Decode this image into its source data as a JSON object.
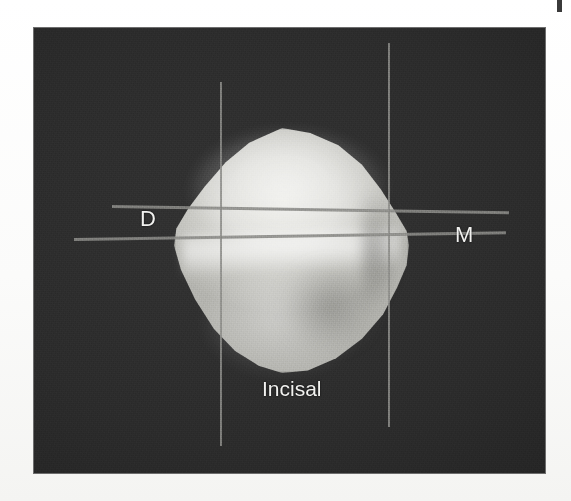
{
  "figure": {
    "kind": "tooth-incisal-view-photograph",
    "background_color": "#2b2b2b",
    "page_color": "#fdfdfc",
    "label_color": "#f2f2f0",
    "line_color": "#8d8d8a"
  },
  "labels": {
    "distal": "D",
    "mesial": "M",
    "incisal": "Incisal"
  },
  "reference_lines": [
    {
      "name": "vertical-distal-line",
      "orientation": "vertical"
    },
    {
      "name": "vertical-mesial-line",
      "orientation": "vertical"
    },
    {
      "name": "horizontal-upper-line",
      "orientation": "horizontal"
    },
    {
      "name": "horizontal-lower-line",
      "orientation": "horizontal"
    }
  ],
  "edge_mark": {
    "name": "page-edge-mark"
  }
}
